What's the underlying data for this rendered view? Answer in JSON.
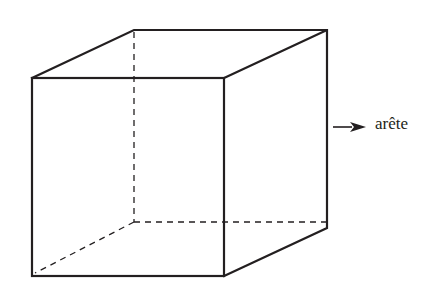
{
  "diagram": {
    "type": "cube-edge-illustration",
    "label": "arête",
    "colors": {
      "stroke": "#231f20",
      "background": "#ffffff"
    },
    "vertices": {
      "front_top_left": [
        32,
        78
      ],
      "front_top_right": [
        224,
        78
      ],
      "front_bottom_left": [
        32,
        276
      ],
      "front_bottom_right": [
        224,
        276
      ],
      "back_top_left": [
        134,
        30
      ],
      "back_top_right": [
        327,
        30
      ],
      "back_bottom_left": [
        134,
        222
      ],
      "back_bottom_right": [
        327,
        222
      ]
    },
    "hidden_edges": [
      "back_top_left-back_bottom_left",
      "back_bottom_left-back_bottom_right",
      "back_bottom_left-front_bottom_left"
    ],
    "arrow": {
      "from": [
        332,
        127
      ],
      "to": [
        365,
        127
      ],
      "points_to": "label"
    }
  }
}
